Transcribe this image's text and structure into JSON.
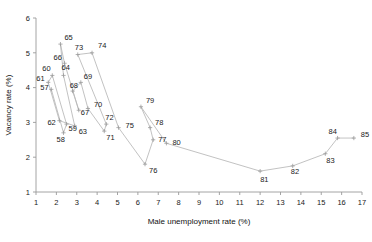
{
  "chart_data": {
    "type": "line",
    "title": "",
    "xlabel": "Male unemployment rate (%)",
    "ylabel": "Vacancy rate (%)",
    "xlim": [
      1,
      17
    ],
    "ylim": [
      1,
      6
    ],
    "xticks": [
      1,
      2,
      3,
      4,
      5,
      6,
      7,
      8,
      9,
      10,
      11,
      12,
      13,
      14,
      15,
      16,
      17
    ],
    "yticks": [
      1,
      2,
      3,
      4,
      5,
      6
    ],
    "grid": false,
    "legend": null,
    "marker": "plus",
    "line_color": "#b7b7b7",
    "point_label_position": "offset",
    "points": [
      {
        "label": "57",
        "x": 1.75,
        "y": 3.95
      },
      {
        "label": "58",
        "x": 2.35,
        "y": 2.7
      },
      {
        "label": "59",
        "x": 2.5,
        "y": 2.95
      },
      {
        "label": "60",
        "x": 1.8,
        "y": 4.35
      },
      {
        "label": "61",
        "x": 1.6,
        "y": 4.15
      },
      {
        "label": "62",
        "x": 2.15,
        "y": 3.05
      },
      {
        "label": "63",
        "x": 2.9,
        "y": 2.9
      },
      {
        "label": "64",
        "x": 2.35,
        "y": 4.35
      },
      {
        "label": "65",
        "x": 2.2,
        "y": 5.25
      },
      {
        "label": "66",
        "x": 2.4,
        "y": 4.7
      },
      {
        "label": "67",
        "x": 3.1,
        "y": 3.35
      },
      {
        "label": "68",
        "x": 2.8,
        "y": 3.9
      },
      {
        "label": "69",
        "x": 3.2,
        "y": 4.15
      },
      {
        "label": "70",
        "x": 3.55,
        "y": 3.4
      },
      {
        "label": "71",
        "x": 4.35,
        "y": 2.75
      },
      {
        "label": "72",
        "x": 4.45,
        "y": 2.95
      },
      {
        "label": "73",
        "x": 3.05,
        "y": 4.95
      },
      {
        "label": "74",
        "x": 3.75,
        "y": 5.0
      },
      {
        "label": "75",
        "x": 5.05,
        "y": 2.85
      },
      {
        "label": "76",
        "x": 6.35,
        "y": 1.8
      },
      {
        "label": "77",
        "x": 6.75,
        "y": 2.5
      },
      {
        "label": "78",
        "x": 6.6,
        "y": 2.85
      },
      {
        "label": "79",
        "x": 6.15,
        "y": 3.45
      },
      {
        "label": "80",
        "x": 7.4,
        "y": 2.4
      },
      {
        "label": "81",
        "x": 12.0,
        "y": 1.6
      },
      {
        "label": "82",
        "x": 13.6,
        "y": 1.75
      },
      {
        "label": "83",
        "x": 15.2,
        "y": 2.1
      },
      {
        "label": "84",
        "x": 15.8,
        "y": 2.55
      },
      {
        "label": "85",
        "x": 16.6,
        "y": 2.55
      }
    ],
    "label_offsets": {
      "57": [
        -11,
        1
      ],
      "58": [
        -7,
        9
      ],
      "59": [
        2,
        7
      ],
      "60": [
        -10,
        -4
      ],
      "61": [
        -12,
        -1
      ],
      "62": [
        -12,
        4
      ],
      "63": [
        4,
        8
      ],
      "64": [
        -2,
        -5
      ],
      "65": [
        4,
        -4
      ],
      "66": [
        -11,
        -3
      ],
      "67": [
        2,
        5
      ],
      "68": [
        -3,
        -3
      ],
      "69": [
        3,
        -3
      ],
      "70": [
        6,
        -1
      ],
      "71": [
        2,
        9
      ],
      "72": [
        -1,
        -4
      ],
      "73": [
        -3,
        -5
      ],
      "74": [
        6,
        -5
      ],
      "75": [
        7,
        0
      ],
      "76": [
        4,
        9
      ],
      "77": [
        5,
        2
      ],
      "78": [
        5,
        -3
      ],
      "79": [
        5,
        -4
      ],
      "80": [
        6,
        2
      ],
      "81": [
        0,
        11
      ],
      "82": [
        -2,
        8
      ],
      "83": [
        1,
        9
      ],
      "84": [
        -9,
        -4
      ],
      "85": [
        7,
        -1
      ]
    }
  }
}
